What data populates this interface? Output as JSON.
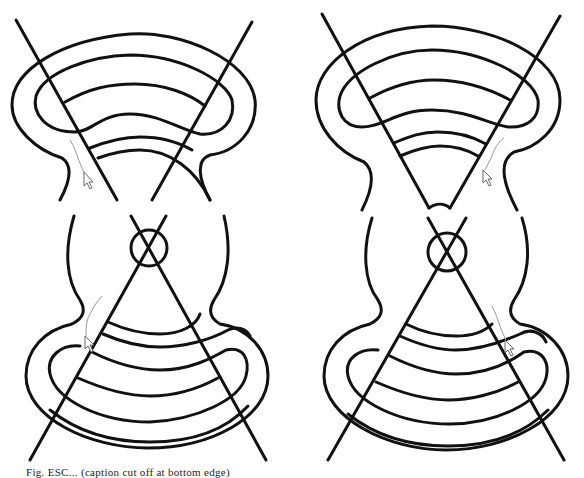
{
  "figure": {
    "panels": [
      {
        "id": "top-left",
        "description": "Outer-rings tool path shape with two crossing lines, cursor with trail left of center"
      },
      {
        "id": "top-right",
        "description": "Outer-rings shape with V-shaped wedge, cursor with trail right of wedge"
      },
      {
        "id": "bottom-left",
        "description": "Circular top section with small crossed circle, lower rings, cursor with trail at left"
      },
      {
        "id": "bottom-right",
        "description": "Circular top section with small crossed circle, lower rings, cursor with trail at right"
      }
    ],
    "stroke_color": "#111111",
    "trail_color": "#9a9a9a",
    "background": "#ffffff"
  },
  "caption": {
    "text": "Fig. ESC... (caption cut off at bottom edge)"
  }
}
